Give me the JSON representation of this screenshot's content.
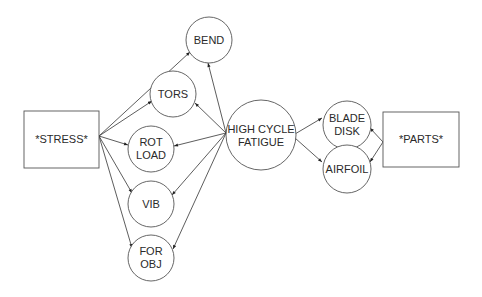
{
  "diagram": {
    "nodes": {
      "stress": {
        "label": "*STRESS*",
        "shape": "rect"
      },
      "parts": {
        "label": "*PARTS*",
        "shape": "rect"
      },
      "hcf": {
        "lines": [
          "HIGH CYCLE",
          "FATIGUE"
        ],
        "shape": "circle"
      },
      "bend": {
        "lines": [
          "BEND"
        ],
        "shape": "circle"
      },
      "tors": {
        "lines": [
          "TORS"
        ],
        "shape": "circle"
      },
      "rotload": {
        "lines": [
          "ROT",
          "LOAD"
        ],
        "shape": "circle"
      },
      "vib": {
        "lines": [
          "VIB"
        ],
        "shape": "circle"
      },
      "forobj": {
        "lines": [
          "FOR",
          "OBJ"
        ],
        "shape": "circle"
      },
      "bladedisk": {
        "lines": [
          "BLADE",
          "DISK"
        ],
        "shape": "circle"
      },
      "airfoil": {
        "lines": [
          "AIRFOIL"
        ],
        "shape": "circle"
      }
    },
    "edges": [
      {
        "from": "stress",
        "to": "bend"
      },
      {
        "from": "stress",
        "to": "tors"
      },
      {
        "from": "stress",
        "to": "rotload"
      },
      {
        "from": "stress",
        "to": "vib"
      },
      {
        "from": "stress",
        "to": "forobj"
      },
      {
        "from": "hcf",
        "to": "bend"
      },
      {
        "from": "hcf",
        "to": "tors"
      },
      {
        "from": "hcf",
        "to": "rotload"
      },
      {
        "from": "hcf",
        "to": "vib"
      },
      {
        "from": "hcf",
        "to": "forobj"
      },
      {
        "from": "hcf",
        "to": "bladedisk"
      },
      {
        "from": "hcf",
        "to": "airfoil"
      },
      {
        "from": "parts",
        "to": "bladedisk"
      },
      {
        "from": "parts",
        "to": "airfoil"
      }
    ]
  }
}
